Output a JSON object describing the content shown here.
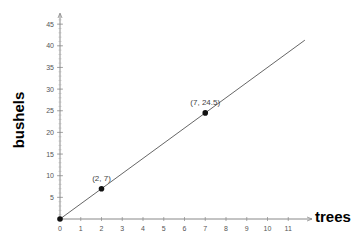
{
  "chart_data": {
    "type": "line",
    "title": "",
    "xlabel": "trees",
    "ylabel": "bushels",
    "xlim": [
      0,
      11.8
    ],
    "ylim": [
      0,
      46
    ],
    "xticks": [
      0,
      1,
      2,
      3,
      4,
      5,
      6,
      7,
      8,
      9,
      10,
      11
    ],
    "yticks": [
      5,
      10,
      15,
      20,
      25,
      30,
      35,
      40,
      45
    ],
    "grid": false,
    "legend": null,
    "series": [
      {
        "name": "y = 3.5x",
        "x": [
          0,
          11.8
        ],
        "y": [
          0,
          41.3
        ]
      }
    ],
    "points": [
      {
        "x": 0,
        "y": 0,
        "label": ""
      },
      {
        "x": 2,
        "y": 7,
        "label": "(2, 7)"
      },
      {
        "x": 7,
        "y": 24.5,
        "label": "(7, 24.5)"
      }
    ]
  }
}
